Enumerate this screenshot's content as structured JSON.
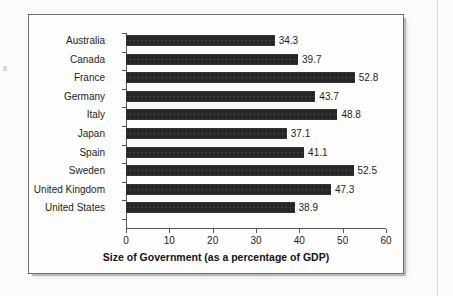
{
  "chart_data": {
    "type": "bar",
    "orientation": "horizontal",
    "title": "",
    "xlabel": "Size of Government (as a percentage of GDP)",
    "ylabel": "",
    "xlim": [
      0,
      60
    ],
    "xticks": [
      0,
      10,
      20,
      30,
      40,
      50,
      60
    ],
    "grid": false,
    "legend": null,
    "bar_color": "#242424",
    "categories": [
      "Australia",
      "Canada",
      "France",
      "Germany",
      "Italy",
      "Japan",
      "Spain",
      "Sweden",
      "United Kingdom",
      "United States"
    ],
    "values": [
      34.3,
      39.7,
      52.8,
      43.7,
      48.8,
      37.1,
      41.1,
      52.5,
      47.3,
      38.9
    ],
    "data_labels": [
      "34.3",
      "39.7",
      "52.8",
      "43.7",
      "48.8",
      "37.1",
      "41.1",
      "52.5",
      "47.3",
      "38.9"
    ]
  },
  "axis": {
    "x_tick_labels": [
      "0",
      "10",
      "20",
      "30",
      "40",
      "50",
      "60"
    ],
    "x_title": "Size of Government (as a percentage of GDP)"
  }
}
